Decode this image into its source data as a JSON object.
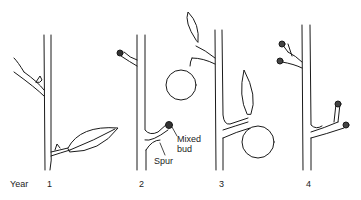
{
  "diagram": {
    "row_label": "Year",
    "stages": [
      {
        "year": "1"
      },
      {
        "year": "2"
      },
      {
        "year": "3"
      },
      {
        "year": "4"
      }
    ],
    "annotations": {
      "spur": "Spur",
      "mixed_bud_line1": "Mixed",
      "mixed_bud_line2": "bud"
    },
    "colors": {
      "ink": "#1a1a1a",
      "background": "#ffffff"
    }
  }
}
